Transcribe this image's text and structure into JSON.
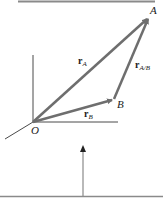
{
  "diagram": {
    "points": {
      "origin": {
        "label": "O",
        "x": 33,
        "y": 122
      },
      "A": {
        "label": "A",
        "x": 148,
        "y": 18
      },
      "B": {
        "label": "B",
        "x": 113,
        "y": 99
      }
    },
    "vectors": [
      {
        "name": "r_A",
        "bold": "r",
        "sub": "A",
        "from": "O",
        "to": "A"
      },
      {
        "name": "r_B",
        "bold": "r",
        "sub": "B",
        "from": "O",
        "to": "B"
      },
      {
        "name": "r_A/B",
        "bold": "r",
        "sub": "A/B",
        "from": "B",
        "to": "A"
      }
    ],
    "colors": {
      "vector": "#6e6e6e",
      "axis": "#4a4a4a",
      "rule": "#8a8a8a"
    }
  },
  "labels": {
    "A": "A",
    "B": "B",
    "O": "O",
    "rA_r": "r",
    "rA_sub": "A",
    "rB_r": "r",
    "rB_sub": "B",
    "rAB_r": "r",
    "rAB_sub": "A/B"
  }
}
